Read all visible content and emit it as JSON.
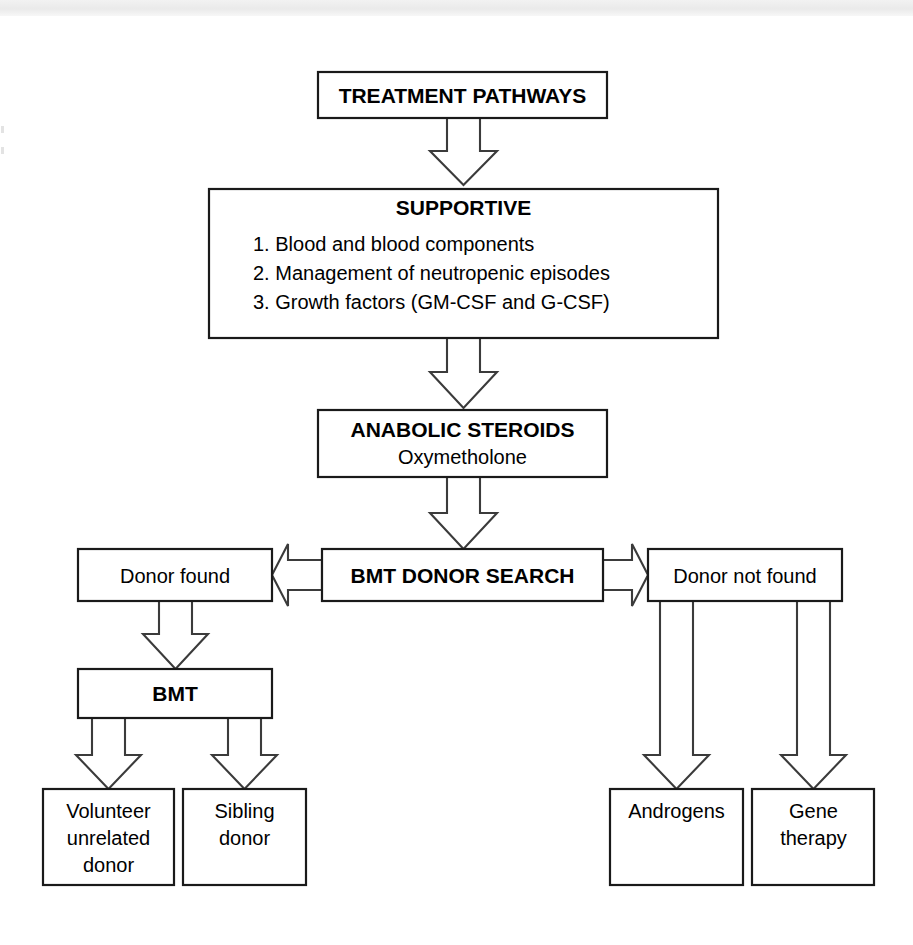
{
  "diagram": {
    "title": "TREATMENT PATHWAYS",
    "nodes": {
      "root": {
        "label": "TREATMENT PATHWAYS"
      },
      "supportive": {
        "heading": "SUPPORTIVE",
        "items": [
          "1. Blood and blood components",
          "2. Management of neutropenic episodes",
          "3. Growth factors (GM-CSF and G-CSF)"
        ]
      },
      "anabolic": {
        "heading": "ANABOLIC STEROIDS",
        "subtitle": "Oxymetholone"
      },
      "bmt_search": {
        "label": "BMT DONOR SEARCH"
      },
      "donor_found": {
        "label": "Donor found"
      },
      "donor_not_found": {
        "label": "Donor not found"
      },
      "bmt": {
        "label": "BMT"
      },
      "volunteer": {
        "line1": "Volunteer",
        "line2": "unrelated",
        "line3": "donor"
      },
      "sibling": {
        "line1": "Sibling",
        "line2": "donor"
      },
      "androgens": {
        "label": "Androgens"
      },
      "gene_therapy": {
        "line1": "Gene",
        "line2": "therapy"
      }
    },
    "colors": {
      "box_stroke": "#1a1a1a",
      "arrow_stroke": "#3b3b3b",
      "box_fill": "#ffffff",
      "text": "#000000",
      "page_bg": "#ffffff"
    }
  }
}
